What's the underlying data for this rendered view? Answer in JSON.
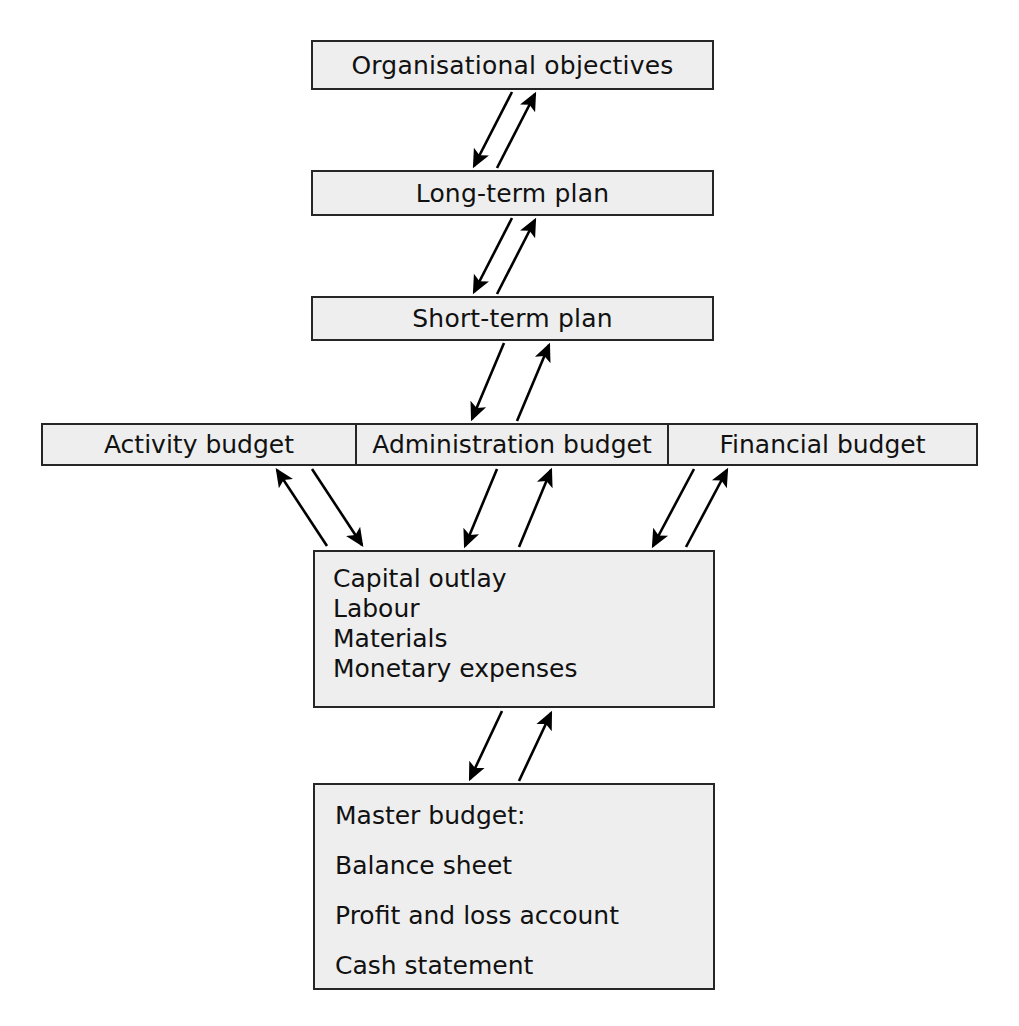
{
  "diagram": {
    "style": {
      "box_fill": "#eeeeee",
      "box_border": "#262626",
      "text_color": "#111111",
      "arrow_color": "#000000",
      "page_background": "#ffffff"
    },
    "nodes": {
      "objectives": {
        "label": "Organisational objectives"
      },
      "long_term_plan": {
        "label": "Long-term plan"
      },
      "short_term_plan": {
        "label": "Short-term plan"
      },
      "activity_budget": {
        "label": "Activity budget"
      },
      "administration_budget": {
        "label": "Administration budget"
      },
      "financial_budget": {
        "label": "Financial budget"
      },
      "resources": {
        "lines": [
          "Capital outlay",
          "Labour",
          "Materials",
          "Monetary expenses"
        ]
      },
      "master_budget": {
        "lines": [
          "Master budget:",
          "Balance sheet",
          "Profit and loss account",
          "Cash statement"
        ]
      }
    },
    "connections": [
      {
        "from": "objectives",
        "to": "long_term_plan",
        "kind": "bidirectional-pair"
      },
      {
        "from": "long_term_plan",
        "to": "short_term_plan",
        "kind": "bidirectional-pair"
      },
      {
        "from": "short_term_plan",
        "to": "administration_budget",
        "kind": "bidirectional-pair"
      },
      {
        "from": "activity_budget",
        "to": "resources",
        "kind": "bidirectional-pair"
      },
      {
        "from": "administration_budget",
        "to": "resources",
        "kind": "bidirectional-pair"
      },
      {
        "from": "financial_budget",
        "to": "resources",
        "kind": "bidirectional-pair"
      },
      {
        "from": "resources",
        "to": "master_budget",
        "kind": "bidirectional-pair"
      }
    ]
  }
}
